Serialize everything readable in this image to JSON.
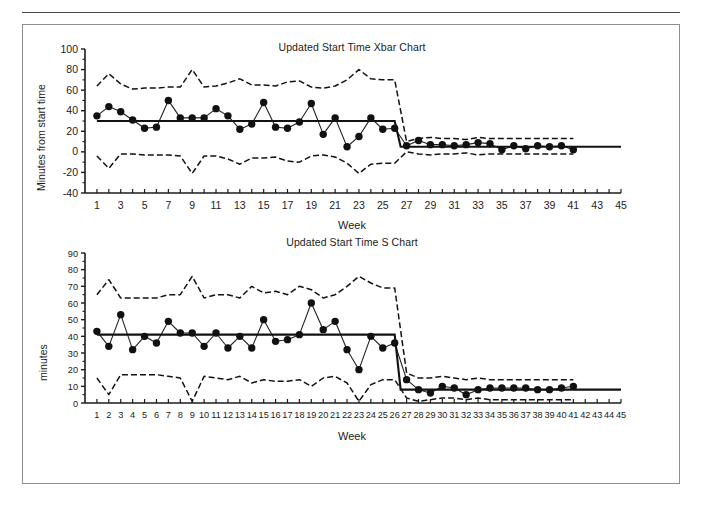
{
  "page": {
    "background": "#ffffff",
    "rule_color": "#4a4a4a",
    "box_border_color": "#8d8d8d"
  },
  "chart_data": [
    {
      "id": "xbar",
      "type": "line",
      "title": "Updated Start Time Xbar Chart",
      "xlabel": "Week",
      "ylabel": "Minutes from start time",
      "xlim": [
        0,
        45
      ],
      "ylim": [
        -40,
        100
      ],
      "ytick_step": 20,
      "yticks": [
        -40,
        -20,
        0,
        20,
        40,
        60,
        80,
        100
      ],
      "xtick_labels": [
        1,
        3,
        5,
        7,
        9,
        11,
        13,
        15,
        17,
        19,
        21,
        23,
        25,
        27,
        29,
        31,
        33,
        35,
        37,
        39,
        41,
        43,
        45
      ],
      "xtick_all": [
        1,
        2,
        3,
        4,
        5,
        6,
        7,
        8,
        9,
        10,
        11,
        12,
        13,
        14,
        15,
        16,
        17,
        18,
        19,
        20,
        21,
        22,
        23,
        24,
        25,
        26,
        27,
        28,
        29,
        30,
        31,
        32,
        33,
        34,
        35,
        36,
        37,
        38,
        39,
        40,
        41,
        42,
        43,
        44,
        45
      ],
      "grid": false,
      "legend": "none",
      "series": [
        {
          "name": "Xbar",
          "style": "solid-with-markers",
          "x": [
            1,
            2,
            3,
            4,
            5,
            6,
            7,
            8,
            9,
            10,
            11,
            12,
            13,
            14,
            15,
            16,
            17,
            18,
            19,
            20,
            21,
            22,
            23,
            24,
            25,
            26,
            27,
            28,
            29,
            30,
            31,
            32,
            33,
            34,
            35,
            36,
            37,
            38,
            39,
            40,
            41
          ],
          "values": [
            35,
            44,
            39,
            31,
            23,
            24,
            50,
            33,
            33,
            33,
            42,
            35,
            22,
            27,
            48,
            24,
            23,
            29,
            47,
            17,
            33,
            5,
            15,
            33,
            22,
            23,
            6,
            11,
            7,
            7,
            6,
            7,
            9,
            8,
            2,
            6,
            3,
            6,
            5,
            6,
            2
          ]
        },
        {
          "name": "Center line (CL)",
          "style": "solid-step",
          "x": [
            1,
            26,
            26.5,
            41,
            45
          ],
          "values": [
            30,
            30,
            5,
            5,
            5
          ]
        },
        {
          "name": "Upper control limit (UCL)",
          "style": "dashed",
          "x": [
            1,
            2,
            3,
            4,
            5,
            6,
            7,
            8,
            9,
            10,
            11,
            12,
            13,
            14,
            15,
            16,
            17,
            18,
            19,
            20,
            21,
            22,
            23,
            24,
            25,
            26,
            27,
            28,
            29,
            30,
            31,
            32,
            33,
            34,
            35,
            36,
            37,
            38,
            39,
            40,
            41
          ],
          "values": [
            64,
            76,
            66,
            61,
            62,
            62,
            63,
            63,
            80,
            63,
            64,
            67,
            71,
            65,
            65,
            64,
            68,
            69,
            63,
            62,
            64,
            70,
            80,
            71,
            70,
            70,
            10,
            13,
            14,
            13,
            13,
            12,
            14,
            13,
            13,
            13,
            13,
            13,
            13,
            13,
            13
          ]
        },
        {
          "name": "Lower control limit (LCL)",
          "style": "dashed",
          "x": [
            1,
            2,
            3,
            4,
            5,
            6,
            7,
            8,
            9,
            10,
            11,
            12,
            13,
            14,
            15,
            16,
            17,
            18,
            19,
            20,
            21,
            22,
            23,
            24,
            25,
            26,
            27,
            28,
            29,
            30,
            31,
            32,
            33,
            34,
            35,
            36,
            37,
            38,
            39,
            40,
            41
          ],
          "values": [
            -4,
            -16,
            -2,
            -2,
            -3,
            -3,
            -3,
            -4,
            -21,
            -4,
            -4,
            -7,
            -12,
            -6,
            -6,
            -5,
            -9,
            -10,
            -4,
            -3,
            -5,
            -11,
            -21,
            -12,
            -11,
            -11,
            0,
            -2,
            -3,
            -2,
            -2,
            -1,
            -3,
            -2,
            -2,
            -2,
            -2,
            -2,
            -2,
            -2,
            -2
          ]
        }
      ]
    },
    {
      "id": "s",
      "type": "line",
      "title": "Updated Start Time S Chart",
      "xlabel": "Week",
      "ylabel": "minutes",
      "xlim": [
        0,
        45
      ],
      "ylim": [
        0,
        90
      ],
      "ytick_step": 10,
      "yticks": [
        0,
        10,
        20,
        30,
        40,
        50,
        60,
        70,
        80,
        90
      ],
      "xtick_labels": [
        1,
        2,
        3,
        4,
        5,
        6,
        7,
        8,
        9,
        10,
        11,
        12,
        13,
        14,
        15,
        16,
        17,
        18,
        19,
        20,
        21,
        22,
        23,
        24,
        25,
        26,
        27,
        28,
        29,
        30,
        31,
        32,
        33,
        34,
        35,
        36,
        37,
        38,
        39,
        40,
        41,
        42,
        43,
        44,
        45
      ],
      "xtick_all": [
        1,
        2,
        3,
        4,
        5,
        6,
        7,
        8,
        9,
        10,
        11,
        12,
        13,
        14,
        15,
        16,
        17,
        18,
        19,
        20,
        21,
        22,
        23,
        24,
        25,
        26,
        27,
        28,
        29,
        30,
        31,
        32,
        33,
        34,
        35,
        36,
        37,
        38,
        39,
        40,
        41,
        42,
        43,
        44,
        45
      ],
      "grid": false,
      "legend": "none",
      "series": [
        {
          "name": "S",
          "style": "solid-with-markers",
          "x": [
            1,
            2,
            3,
            4,
            5,
            6,
            7,
            8,
            9,
            10,
            11,
            12,
            13,
            14,
            15,
            16,
            17,
            18,
            19,
            20,
            21,
            22,
            23,
            24,
            25,
            26,
            27,
            28,
            29,
            30,
            31,
            32,
            33,
            34,
            35,
            36,
            37,
            38,
            39,
            40,
            41
          ],
          "values": [
            43,
            34,
            53,
            32,
            40,
            36,
            49,
            42,
            42,
            34,
            42,
            33,
            40,
            33,
            50,
            37,
            38,
            41,
            60,
            44,
            49,
            32,
            20,
            40,
            33,
            36,
            14,
            8,
            6,
            10,
            9,
            5,
            8,
            9,
            9,
            9,
            9,
            8,
            8,
            9,
            10
          ]
        },
        {
          "name": "Center line (CL)",
          "style": "solid-step",
          "x": [
            1,
            26,
            26.5,
            41,
            45
          ],
          "values": [
            41,
            41,
            8,
            8,
            8
          ]
        },
        {
          "name": "Upper control limit (UCL)",
          "style": "dashed",
          "x": [
            1,
            2,
            3,
            4,
            5,
            6,
            7,
            8,
            9,
            10,
            11,
            12,
            13,
            14,
            15,
            16,
            17,
            18,
            19,
            20,
            21,
            22,
            23,
            24,
            25,
            26,
            27,
            28,
            29,
            30,
            31,
            32,
            33,
            34,
            35,
            36,
            37,
            38,
            39,
            40,
            41
          ],
          "values": [
            65,
            74,
            63,
            63,
            63,
            63,
            65,
            65,
            76,
            63,
            65,
            65,
            63,
            70,
            66,
            67,
            65,
            70,
            68,
            63,
            65,
            70,
            76,
            72,
            69,
            69,
            18,
            15,
            15,
            16,
            15,
            14,
            15,
            14,
            14,
            14,
            14,
            14,
            14,
            14,
            14
          ]
        },
        {
          "name": "Lower control limit (LCL)",
          "style": "dashed",
          "x": [
            1,
            2,
            3,
            4,
            5,
            6,
            7,
            8,
            9,
            10,
            11,
            12,
            13,
            14,
            15,
            16,
            17,
            18,
            19,
            20,
            21,
            22,
            23,
            24,
            25,
            26,
            27,
            28,
            29,
            30,
            31,
            32,
            33,
            34,
            35,
            36,
            37,
            38,
            39,
            40,
            41
          ],
          "values": [
            15,
            5,
            17,
            17,
            17,
            17,
            16,
            15,
            1,
            16,
            15,
            14,
            16,
            12,
            14,
            13,
            13,
            14,
            10,
            15,
            16,
            12,
            1,
            11,
            14,
            14,
            3,
            1,
            2,
            3,
            3,
            2,
            3,
            2,
            2,
            2,
            2,
            2,
            2,
            2,
            2
          ]
        }
      ]
    }
  ]
}
